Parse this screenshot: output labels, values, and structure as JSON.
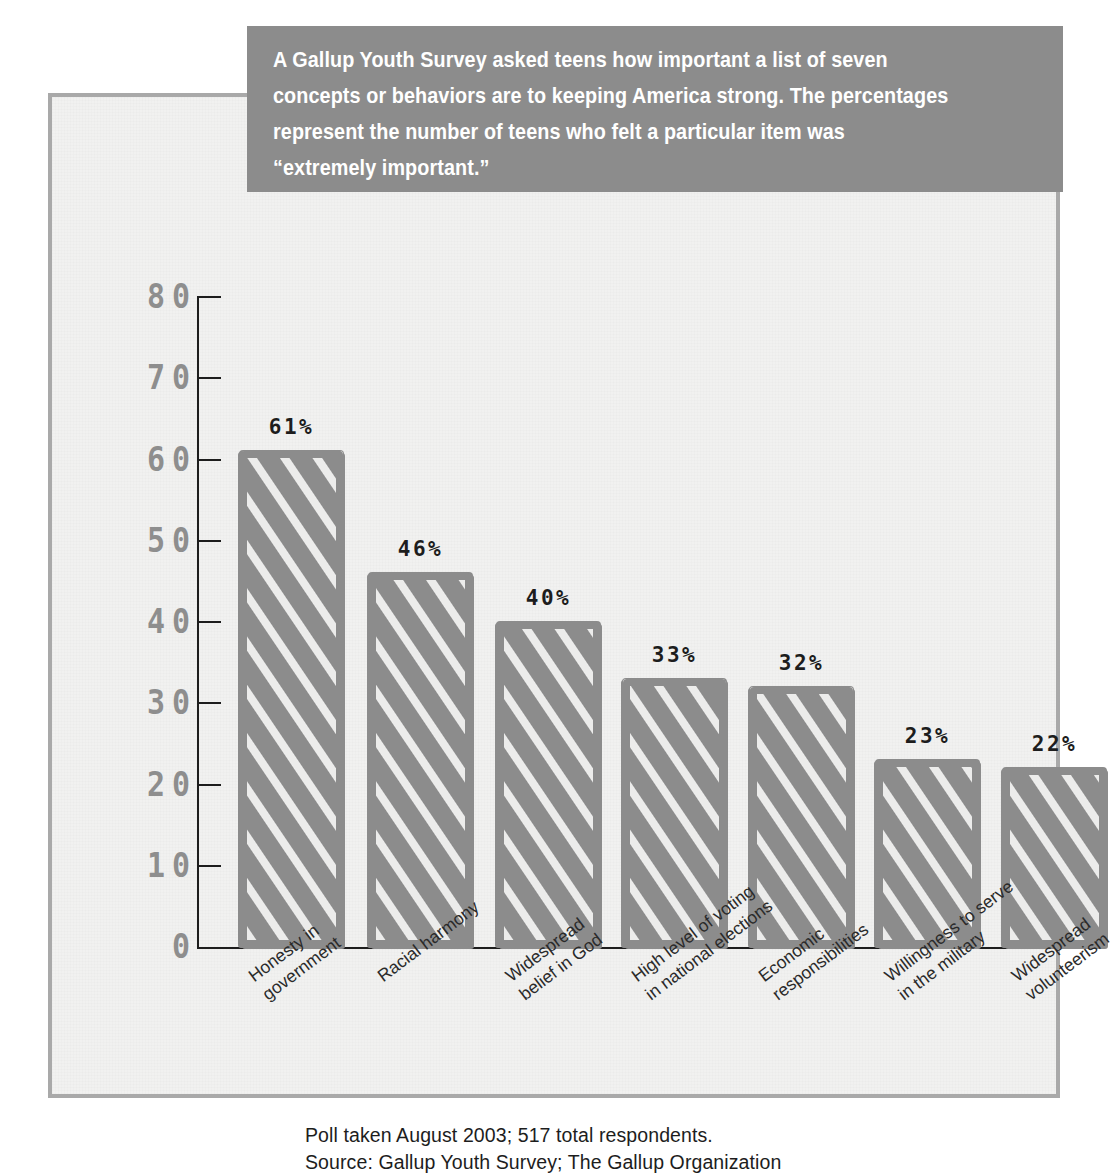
{
  "banner": {
    "text": "A Gallup Youth Survey asked teens how important a list of seven\nconcepts or behaviors are to keeping America strong. The percentages\nrepresent the number of teens who felt a particular item was\n“extremely important.”"
  },
  "footnote": {
    "text": "Poll taken August 2003; 517 total respondents.\nSource: Gallup Youth Survey; The Gallup Organization"
  },
  "colors": {
    "bar_fill": "#8c8c8c",
    "bar_hatch": "#ececeb",
    "banner_bg": "#8c8c8c",
    "banner_text": "#ffffff",
    "panel_bg": "#f1f1f0",
    "panel_border": "#a9a9a9",
    "axis": "#1d1d1d",
    "tick_label": "#8e8e8e",
    "category_label": "#2a2a2a"
  },
  "chart_data": {
    "type": "bar",
    "title": "",
    "subtitle": "",
    "xlabel": "",
    "ylabel": "",
    "ylim": [
      0,
      80
    ],
    "yticks": [
      0,
      10,
      20,
      30,
      40,
      50,
      60,
      70,
      80
    ],
    "ytick_labels": [
      "0",
      "10",
      "20",
      "30",
      "40",
      "50",
      "60",
      "70",
      "80"
    ],
    "grid": false,
    "legend": false,
    "legend_position": "none",
    "value_suffix": "%",
    "categories": [
      "Honesty in\ngovernment",
      "Racial harmony",
      "Widespread\nbelief in God",
      "High level of voting\nin national elections",
      "Economic\nresponsibilities",
      "Willingness to serve\nin the military",
      "Widespread\nvolunteerism"
    ],
    "values": [
      61,
      46,
      40,
      33,
      32,
      23,
      22
    ],
    "data_labels": [
      "61%",
      "46%",
      "40%",
      "33%",
      "32%",
      "23%",
      "22%"
    ]
  }
}
